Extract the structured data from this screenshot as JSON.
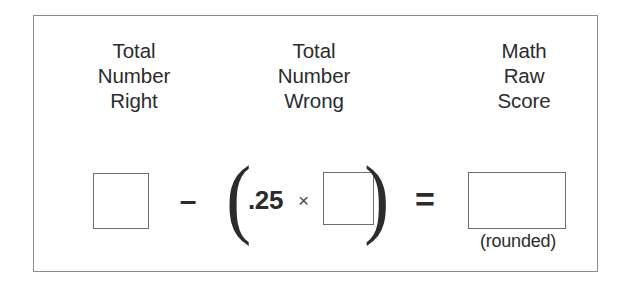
{
  "panel": {
    "border_color": "#8d8d8d",
    "background_color": "#ffffff",
    "text_color": "#2c2c2c",
    "box_border_color": "#6f6f6f"
  },
  "headers": [
    {
      "name": "total-number-right",
      "line1": "Total",
      "line2": "Number",
      "line3": "Right"
    },
    {
      "name": "total-number-wrong",
      "line1": "Total",
      "line2": "Number",
      "line3": "Wrong"
    },
    {
      "name": "math-raw-score",
      "line1": "Math",
      "line2": "Raw",
      "line3": "Score"
    }
  ],
  "equation": {
    "box_number_right_value": "",
    "minus_operator": "–",
    "paren_open": "(",
    "factor_value": ".25",
    "times_operator": "×",
    "box_number_wrong_value": "",
    "paren_close": ")",
    "equals_operator": "=",
    "box_raw_score_value": "",
    "rounded_note": "(rounded)"
  }
}
